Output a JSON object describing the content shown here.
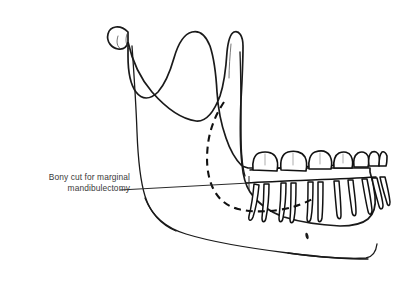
{
  "figure": {
    "background_color": "#ffffff",
    "width": 393,
    "height": 286
  },
  "annotation": {
    "label": "Bony cut for marginal\nmandibulectomy",
    "line1": "Bony cut for marginal",
    "line2": "mandibulectomy",
    "text_color": "#3a3a3a",
    "leader_line_color": "#2b2b2b"
  },
  "anatomy": {
    "structure": "mandible",
    "view": "lateral oblique",
    "outline_color": "#1a1a1a",
    "fill_color": "#ffffff",
    "parts": [
      {
        "name": "coronoid-process",
        "label": "Coronoid process"
      },
      {
        "name": "condyle",
        "label": "Condyle"
      },
      {
        "name": "sigmoid-notch",
        "label": "Sigmoid notch"
      },
      {
        "name": "ramus",
        "label": "Ramus"
      },
      {
        "name": "gonial-angle",
        "label": "Angle of mandible"
      },
      {
        "name": "body",
        "label": "Body of mandible"
      },
      {
        "name": "symphysis",
        "label": "Symphysis"
      },
      {
        "name": "alveolar-ridge",
        "label": "Alveolar ridge"
      },
      {
        "name": "mental-foramen",
        "label": "Mental foramen"
      }
    ]
  },
  "cut": {
    "name": "marginal-mandibulectomy-cut",
    "style": "dashed",
    "color": "#111111",
    "dash_pattern": "7 5",
    "stroke_width": 2.1
  },
  "dentition": {
    "arch": "lower",
    "crown_color": "#ffffff",
    "outline_color": "#111111",
    "teeth": [
      {
        "name": "tooth-molar-3",
        "type": "molar"
      },
      {
        "name": "tooth-molar-2",
        "type": "molar"
      },
      {
        "name": "tooth-molar-1",
        "type": "molar"
      },
      {
        "name": "tooth-premolar-2",
        "type": "premolar"
      },
      {
        "name": "tooth-premolar-1",
        "type": "premolar"
      },
      {
        "name": "tooth-canine",
        "type": "canine"
      },
      {
        "name": "tooth-incisor-lateral",
        "type": "incisor"
      },
      {
        "name": "tooth-incisor-central",
        "type": "incisor"
      }
    ]
  }
}
